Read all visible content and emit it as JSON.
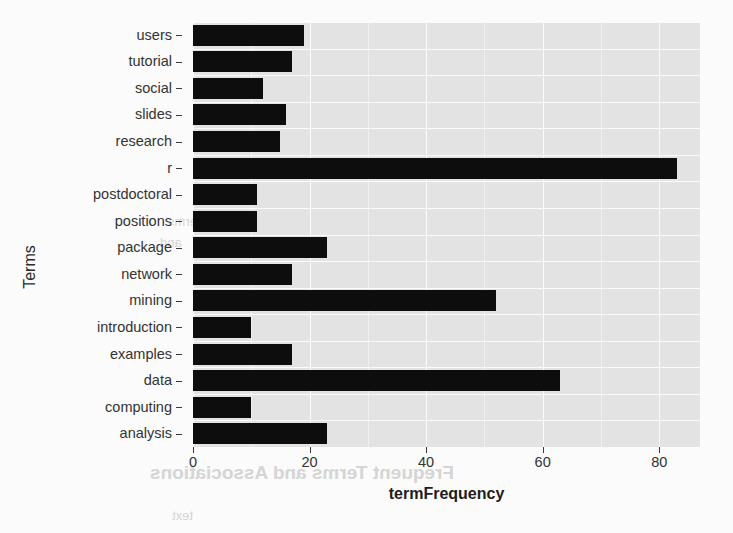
{
  "chart_data": {
    "type": "bar",
    "orientation": "horizontal",
    "title": "",
    "xlabel": "termFrequency",
    "ylabel": "Terms",
    "categories": [
      "users",
      "tutorial",
      "social",
      "slides",
      "research",
      "r",
      "postdoctoral",
      "positions",
      "package",
      "network",
      "mining",
      "introduction",
      "examples",
      "data",
      "computing",
      "analysis"
    ],
    "values": [
      19,
      17,
      12,
      16,
      15,
      83,
      11,
      11,
      23,
      17,
      52,
      10,
      17,
      63,
      10,
      23
    ],
    "xlim": [
      0,
      87
    ],
    "xticks": [
      0,
      20,
      40,
      60,
      80
    ],
    "xtick_labels": [
      "0",
      "20",
      "40",
      "60",
      "80"
    ],
    "grid": true,
    "grid_minor_x": [
      10,
      30,
      50,
      70
    ],
    "legend": "none",
    "bar_color": "#0d0d0d",
    "panel_background": "#e3e3e3",
    "gridline_color": "#fbfbfb",
    "page_background": "#fbfbfb"
  },
  "axes": {
    "y_title": "Terms",
    "x_title": "termFrequency"
  },
  "ghost_text": {
    "heading": "Frequent Terms and Associations",
    "line1": "terms",
    "line2": "and",
    "line3": "text"
  }
}
